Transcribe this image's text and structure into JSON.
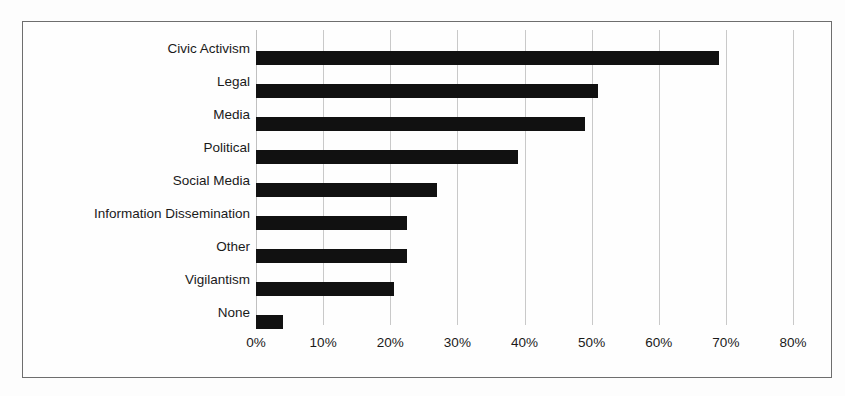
{
  "chart_data": {
    "type": "bar",
    "orientation": "horizontal",
    "title": "",
    "subtitle": "",
    "xlabel": "",
    "ylabel": "",
    "categories": [
      "Civic Activism",
      "Legal",
      "Media",
      "Political",
      "Social Media",
      "Information Dissemination",
      "Other",
      "Vigilantism",
      "None"
    ],
    "values": [
      69,
      51,
      49,
      39,
      27,
      22.5,
      22.5,
      20.5,
      4
    ],
    "value_suffix": "%",
    "xlim": [
      0,
      80
    ],
    "xticks": [
      0,
      10,
      20,
      30,
      40,
      50,
      60,
      70,
      80
    ],
    "xtick_labels": [
      "0%",
      "10%",
      "20%",
      "30%",
      "40%",
      "50%",
      "60%",
      "70%",
      "80%"
    ],
    "grid": "vertical-only",
    "legend": "none",
    "bar_color": "#111111",
    "gridline_color": "#c9c9c9",
    "frame_color": "#6e6e6e",
    "background_color": "#fefefe"
  }
}
